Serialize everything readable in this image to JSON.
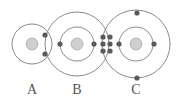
{
  "diagram": {
    "atoms": [
      {
        "label": "A",
        "nucleus": [
          32,
          44
        ],
        "shells": [
          20
        ],
        "electrons": [
          [
            45,
            35
          ],
          [
            45,
            54
          ]
        ]
      },
      {
        "label": "B",
        "nucleus": [
          77,
          44
        ],
        "shells": [
          17,
          32
        ],
        "electrons": [
          [
            60,
            44
          ],
          [
            94,
            44
          ]
        ]
      },
      {
        "label": "C",
        "nucleus": [
          136,
          44
        ],
        "shells": [
          17,
          34
        ],
        "electrons": [
          [
            119,
            44
          ],
          [
            154,
            44
          ],
          [
            137,
            13
          ],
          [
            137,
            78
          ]
        ]
      }
    ],
    "shared_electrons": [
      [
        103,
        37
      ],
      [
        110,
        37
      ],
      [
        103,
        44
      ],
      [
        110,
        44
      ],
      [
        103,
        51
      ],
      [
        110,
        51
      ]
    ],
    "colors": {
      "shell": "#8a8a8a",
      "electron": "#5a5a5a",
      "nucleus": "#cfcfcf"
    }
  },
  "labels": {
    "a": "A",
    "b": "B",
    "c": "C"
  }
}
